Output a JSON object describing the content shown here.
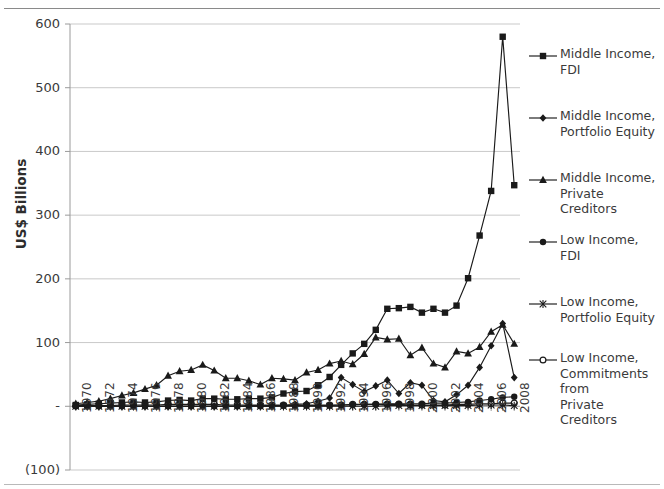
{
  "chart_data": {
    "type": "line",
    "title": "",
    "xlabel": "",
    "ylabel": "US$ Billions",
    "ylim": [
      -100,
      600
    ],
    "yticks": [
      600,
      500,
      400,
      300,
      200,
      100,
      0,
      -100
    ],
    "ytick_labels": [
      "600",
      "500",
      "400",
      "300",
      "200",
      "100",
      "-",
      "(100)"
    ],
    "grid": true,
    "legend_position": "right",
    "x": [
      1970,
      1971,
      1972,
      1973,
      1974,
      1975,
      1976,
      1977,
      1978,
      1979,
      1980,
      1981,
      1982,
      1983,
      1984,
      1985,
      1986,
      1987,
      1988,
      1989,
      1990,
      1991,
      1992,
      1993,
      1994,
      1995,
      1996,
      1997,
      1998,
      1999,
      2000,
      2001,
      2002,
      2003,
      2004,
      2005,
      2006,
      2007,
      2008
    ],
    "xtick_labels": [
      "1970",
      "1972",
      "1974",
      "1976",
      "1978",
      "1980",
      "1982",
      "1984",
      "1986",
      "1988",
      "1990",
      "1992",
      "1994",
      "1996",
      "1998",
      "2000",
      "2002",
      "2004",
      "2006",
      "2008"
    ],
    "xtick_years": [
      1970,
      1972,
      1974,
      1976,
      1978,
      1980,
      1982,
      1984,
      1986,
      1988,
      1990,
      1992,
      1994,
      1996,
      1998,
      2000,
      2002,
      2004,
      2006,
      2008
    ],
    "series": [
      {
        "name": "Middle Income, FDI",
        "label_lines": [
          "Middle Income,",
          "FDI"
        ],
        "marker": "square",
        "color": "#1a1a1a",
        "values": [
          2,
          3,
          4,
          5,
          6,
          7,
          6,
          7,
          9,
          10,
          9,
          12,
          12,
          11,
          11,
          12,
          12,
          14,
          20,
          23,
          24,
          33,
          46,
          65,
          83,
          98,
          120,
          153,
          154,
          156,
          147,
          153,
          147,
          158,
          201,
          268,
          338,
          580,
          347
        ]
      },
      {
        "name": "Middle Income, Portfolio Equity",
        "label_lines": [
          "Middle Income,",
          "Portfolio Equity"
        ],
        "marker": "diamond",
        "color": "#1a1a1a",
        "values": [
          0,
          0,
          0,
          0,
          0,
          0,
          0,
          0,
          0,
          0,
          0,
          0,
          0,
          0,
          0,
          1,
          1,
          1,
          1,
          3,
          4,
          8,
          13,
          45,
          34,
          23,
          32,
          41,
          20,
          37,
          33,
          9,
          7,
          18,
          33,
          61,
          95,
          130,
          45
        ]
      },
      {
        "name": "Middle Income, Private Creditors",
        "label_lines": [
          "Middle Income,",
          "Private Creditors"
        ],
        "marker": "triangle",
        "color": "#1a1a1a",
        "values": [
          4,
          6,
          8,
          12,
          17,
          21,
          27,
          33,
          48,
          55,
          57,
          65,
          56,
          44,
          44,
          40,
          34,
          44,
          43,
          41,
          53,
          57,
          67,
          71,
          66,
          82,
          108,
          105,
          106,
          80,
          92,
          67,
          61,
          86,
          83,
          93,
          117,
          128,
          98
        ]
      },
      {
        "name": "Low Income, FDI",
        "label_lines": [
          "Low Income,",
          "FDI"
        ],
        "marker": "circle",
        "color": "#1a1a1a",
        "values": [
          0,
          0,
          0,
          0,
          0,
          0,
          0,
          0,
          0,
          0,
          0,
          0,
          0,
          0,
          0,
          0,
          0,
          0,
          1,
          1,
          1,
          1,
          1,
          2,
          2,
          3,
          3,
          4,
          4,
          4,
          4,
          5,
          5,
          6,
          7,
          9,
          11,
          14,
          15
        ]
      },
      {
        "name": "Low Income, Portfolio Equity",
        "label_lines": [
          "Low Income,",
          "Portfolio Equity"
        ],
        "marker": "asterisk",
        "color": "#1a1a1a",
        "values": [
          0,
          0,
          0,
          0,
          0,
          0,
          0,
          0,
          0,
          0,
          0,
          0,
          0,
          0,
          0,
          0,
          0,
          0,
          0,
          0,
          0,
          0,
          0,
          0,
          0,
          0,
          0,
          1,
          1,
          1,
          1,
          1,
          1,
          1,
          1,
          2,
          2,
          2,
          1
        ]
      },
      {
        "name": "Low Income, Commitments from Private Creditors",
        "label_lines": [
          "Low Income,",
          "Commitments from",
          "Private Creditors"
        ],
        "marker": "open-circle",
        "color": "#1a1a1a",
        "values": [
          1,
          1,
          1,
          1,
          2,
          2,
          2,
          2,
          3,
          3,
          3,
          3,
          3,
          2,
          2,
          2,
          2,
          2,
          2,
          2,
          2,
          2,
          2,
          2,
          3,
          3,
          3,
          3,
          3,
          2,
          2,
          2,
          2,
          3,
          3,
          4,
          4,
          5,
          5
        ]
      }
    ]
  }
}
